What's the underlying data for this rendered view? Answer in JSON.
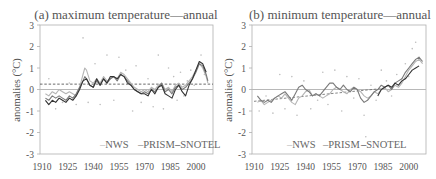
{
  "chart_data": [
    {
      "type": "line",
      "panel": "a",
      "title": "(a) maximum temperature—annual",
      "xlabel": "",
      "ylabel": "anomalies (°C)",
      "xlim": [
        1910,
        2010
      ],
      "ylim": [
        -3,
        3
      ],
      "xticks": [
        1910,
        1925,
        1940,
        1955,
        1970,
        1985,
        2000
      ],
      "yticks": [
        3,
        2,
        1,
        0,
        -1,
        -2,
        -3
      ],
      "grid": false,
      "legend_position": "bottom-inside",
      "reference_lines": [
        {
          "name": "zero",
          "y": 0,
          "style": "solid",
          "color": "#b8b8b8"
        },
        {
          "name": "trend",
          "y": 0.25,
          "style": "dashed",
          "color": "#444444"
        }
      ],
      "series": [
        {
          "name": "NWS",
          "color": "#b5b5b5",
          "width": 1.1,
          "x": [
            1912,
            1914,
            1916,
            1918,
            1920,
            1922,
            1924,
            1926,
            1928,
            1930,
            1932,
            1934,
            1935,
            1936,
            1938,
            1940,
            1942,
            1944,
            1946,
            1948,
            1950,
            1952,
            1954,
            1956,
            1958,
            1960,
            1962,
            1964,
            1966,
            1968,
            1970,
            1972,
            1974,
            1976,
            1978,
            1980,
            1982,
            1984,
            1986,
            1988,
            1990,
            1992,
            1994,
            1996,
            1998,
            2000,
            2002,
            2004,
            2006,
            2007
          ],
          "y": [
            -0.2,
            -0.3,
            -0.1,
            -0.2,
            0.0,
            -0.1,
            -0.2,
            -0.1,
            -0.2,
            -0.3,
            0.1,
            0.7,
            1.0,
            0.9,
            0.4,
            0.3,
            0.5,
            0.3,
            0.6,
            0.4,
            0.5,
            0.6,
            0.5,
            0.8,
            0.7,
            0.5,
            0.3,
            0.1,
            0.0,
            -0.1,
            0.0,
            -0.1,
            0.1,
            0.0,
            0.2,
            0.3,
            0.0,
            0.1,
            -0.1,
            0.2,
            0.3,
            0.1,
            0.2,
            0.4,
            0.6,
            0.9,
            1.2,
            1.0,
            0.6,
            0.3
          ]
        },
        {
          "name": "PRISM",
          "color": "#7a7a7a",
          "width": 1.1,
          "x": [
            1912,
            1914,
            1916,
            1918,
            1920,
            1922,
            1924,
            1926,
            1928,
            1930,
            1932,
            1934,
            1935,
            1936,
            1938,
            1940,
            1942,
            1944,
            1946,
            1948,
            1950,
            1952,
            1954,
            1956,
            1958,
            1960,
            1962,
            1964,
            1966,
            1968,
            1970,
            1972,
            1974,
            1976,
            1978,
            1980,
            1982,
            1984,
            1986,
            1988,
            1990,
            1992,
            1994,
            1996,
            1998,
            2000,
            2002,
            2004,
            2006,
            2007
          ],
          "y": [
            -0.4,
            -0.5,
            -0.3,
            -0.4,
            -0.3,
            -0.4,
            -0.5,
            -0.3,
            -0.4,
            -0.2,
            0.1,
            0.4,
            0.6,
            0.5,
            0.2,
            0.1,
            0.4,
            0.2,
            0.5,
            0.3,
            0.5,
            0.6,
            0.4,
            0.7,
            0.6,
            0.4,
            0.2,
            0.0,
            -0.1,
            -0.2,
            -0.1,
            -0.2,
            0.0,
            -0.1,
            0.1,
            0.3,
            -0.1,
            0.0,
            -0.2,
            0.1,
            0.2,
            0.0,
            0.1,
            0.3,
            0.5,
            0.8,
            1.2,
            1.1,
            0.7,
            0.4
          ]
        },
        {
          "name": "SNOTEL",
          "color": "#333333",
          "width": 1.1,
          "x": [
            1912,
            1914,
            1916,
            1918,
            1920,
            1922,
            1924,
            1926,
            1928,
            1930,
            1932,
            1934,
            1936,
            1938,
            1940,
            1942,
            1944,
            1946,
            1948,
            1950,
            1952,
            1954,
            1956,
            1958,
            1960,
            1962,
            1964,
            1966,
            1968,
            1970,
            1972,
            1974,
            1976,
            1978,
            1980,
            1982,
            1984,
            1986,
            1988,
            1990,
            1992,
            1994,
            1996,
            1998,
            2000,
            2002,
            2004,
            2006
          ],
          "y": [
            -0.5,
            -0.7,
            -0.5,
            -0.6,
            -0.4,
            -0.5,
            -0.6,
            -0.4,
            -0.5,
            -0.3,
            0.0,
            0.4,
            0.5,
            0.2,
            0.1,
            0.5,
            0.2,
            0.5,
            0.3,
            0.6,
            0.6,
            0.5,
            0.7,
            0.6,
            0.3,
            0.2,
            0.0,
            -0.1,
            -0.2,
            -0.2,
            -0.3,
            0.0,
            -0.2,
            0.1,
            0.2,
            -0.2,
            -0.3,
            -0.4,
            0.0,
            0.2,
            -0.1,
            -0.3,
            0.2,
            0.5,
            0.9,
            1.3,
            1.2,
            0.8
          ]
        }
      ],
      "scatter_points": {
        "color": "#bdbdbd",
        "points": [
          [
            1914,
            0.5
          ],
          [
            1918,
            -0.9
          ],
          [
            1922,
            -0.6
          ],
          [
            1926,
            0.3
          ],
          [
            1930,
            -0.7
          ],
          [
            1934,
            2.4
          ],
          [
            1937,
            -0.6
          ],
          [
            1941,
            1.2
          ],
          [
            1944,
            -0.7
          ],
          [
            1948,
            1.6
          ],
          [
            1952,
            -0.5
          ],
          [
            1955,
            1.5
          ],
          [
            1959,
            0.9
          ],
          [
            1963,
            -1.0
          ],
          [
            1965,
            1.1
          ],
          [
            1968,
            -0.6
          ],
          [
            1972,
            0.5
          ],
          [
            1975,
            -0.8
          ],
          [
            1978,
            1.6
          ],
          [
            1981,
            -0.9
          ],
          [
            1984,
            1.0
          ],
          [
            1987,
            0.6
          ],
          [
            1989,
            -0.5
          ],
          [
            1991,
            0.8
          ],
          [
            1993,
            -0.3
          ],
          [
            1995,
            0.4
          ],
          [
            1997,
            0.9
          ],
          [
            1999,
            0.2
          ],
          [
            2001,
            1.0
          ],
          [
            2003,
            1.6
          ],
          [
            2005,
            0.7
          ]
        ]
      },
      "legend": [
        "NWS",
        "PRISM",
        "SNOTEL"
      ]
    },
    {
      "type": "line",
      "panel": "b",
      "title": "(b) minimum temperature—annual",
      "xlabel": "",
      "ylabel": "anomalies (°C)",
      "xlim": [
        1910,
        2010
      ],
      "ylim": [
        -3,
        3
      ],
      "xticks": [
        1910,
        1925,
        1940,
        1955,
        1970,
        1985,
        2000
      ],
      "yticks": [
        3,
        2,
        1,
        0,
        -1,
        -2,
        -3
      ],
      "grid": false,
      "legend_position": "bottom-inside",
      "reference_lines": [
        {
          "name": "zero",
          "y": 0,
          "style": "solid",
          "color": "#b8b8b8"
        },
        {
          "name": "trend",
          "x0": 1910,
          "y0": -0.55,
          "x1": 1985,
          "y1": 0.05,
          "style": "dashed",
          "color": "#666666"
        }
      ],
      "series": [
        {
          "name": "NWS",
          "color": "#b5b5b5",
          "width": 1.1,
          "x": [
            1912,
            1914,
            1916,
            1918,
            1920,
            1922,
            1924,
            1926,
            1928,
            1930,
            1932,
            1934,
            1936,
            1938,
            1940,
            1942,
            1944,
            1946,
            1948,
            1950,
            1952,
            1954,
            1956,
            1958,
            1960,
            1962,
            1964,
            1966,
            1968,
            1970,
            1972,
            1974,
            1976,
            1978,
            1980,
            1982,
            1984,
            1986,
            1988,
            1990,
            1992,
            1994,
            1996,
            1998,
            2000,
            2002,
            2004,
            2006,
            2008
          ],
          "y": [
            -0.6,
            -0.5,
            -0.7,
            -0.6,
            -0.5,
            -0.4,
            -0.3,
            -0.4,
            -0.2,
            -0.4,
            -0.6,
            -0.7,
            -0.4,
            -0.3,
            -0.1,
            0.0,
            -0.3,
            -0.2,
            -0.3,
            -0.4,
            -0.3,
            -0.2,
            0.0,
            0.1,
            0.0,
            -0.1,
            -0.2,
            0.0,
            0.1,
            0.0,
            -0.1,
            -0.3,
            -0.4,
            -0.3,
            -0.1,
            -0.2,
            0.0,
            0.1,
            -0.1,
            0.0,
            0.2,
            0.1,
            0.3,
            0.6,
            0.9,
            1.1,
            1.3,
            1.4,
            1.2
          ]
        },
        {
          "name": "PRISM",
          "color": "#7a7a7a",
          "width": 1.1,
          "x": [
            1912,
            1914,
            1916,
            1918,
            1920,
            1922,
            1924,
            1926,
            1928,
            1930,
            1932,
            1934,
            1936,
            1938,
            1940,
            1942,
            1944,
            1946,
            1948,
            1950,
            1952,
            1954,
            1956,
            1958,
            1960,
            1962,
            1964,
            1966,
            1968,
            1970,
            1972,
            1974,
            1976,
            1978,
            1980,
            1982,
            1984,
            1986,
            1988,
            1990,
            1992,
            1994,
            1996,
            1998,
            2000,
            2002,
            2004,
            2006,
            2008
          ],
          "y": [
            -0.3,
            -0.5,
            -0.6,
            -0.5,
            -0.6,
            -0.4,
            -0.3,
            -0.2,
            -0.1,
            -0.3,
            -0.5,
            -0.2,
            0.1,
            0.2,
            0.0,
            -0.1,
            -0.3,
            -0.2,
            -0.3,
            -0.1,
            0.1,
            0.3,
            0.3,
            0.1,
            0.0,
            0.2,
            0.0,
            -0.1,
            0.1,
            0.0,
            -0.4,
            -0.6,
            -0.5,
            -0.3,
            -0.1,
            0.0,
            0.2,
            0.1,
            0.2,
            0.0,
            0.3,
            0.4,
            0.5,
            0.8,
            1.0,
            1.2,
            1.4,
            1.5,
            1.3
          ]
        },
        {
          "name": "SNOTEL",
          "color": "#333333",
          "width": 1.1,
          "x": [
            1982,
            1984,
            1986,
            1988,
            1990,
            1992,
            1994,
            1996,
            1998,
            2000,
            2002,
            2004,
            2006
          ],
          "y": [
            -0.3,
            0.0,
            0.1,
            0.2,
            0.1,
            0.3,
            0.2,
            0.4,
            0.5,
            0.7,
            0.9,
            1.0,
            1.1
          ]
        }
      ],
      "scatter_points": {
        "color": "#bdbdbd",
        "points": [
          [
            1913,
            -1.0
          ],
          [
            1917,
            -0.3
          ],
          [
            1921,
            -1.1
          ],
          [
            1925,
            0.7
          ],
          [
            1928,
            -0.9
          ],
          [
            1932,
            0.6
          ],
          [
            1935,
            -1.2
          ],
          [
            1939,
            0.4
          ],
          [
            1943,
            -0.9
          ],
          [
            1947,
            -0.5
          ],
          [
            1950,
            0.8
          ],
          [
            1953,
            -0.7
          ],
          [
            1957,
            0.9
          ],
          [
            1961,
            -1.0
          ],
          [
            1964,
            0.6
          ],
          [
            1968,
            -0.4
          ],
          [
            1971,
            0.5
          ],
          [
            1974,
            -1.2
          ],
          [
            1975,
            -2.2
          ],
          [
            1978,
            0.2
          ],
          [
            1981,
            -0.5
          ],
          [
            1984,
            0.9
          ],
          [
            1987,
            0.4
          ],
          [
            1990,
            -0.3
          ],
          [
            1993,
            0.7
          ],
          [
            1996,
            0.5
          ],
          [
            1998,
            1.2
          ],
          [
            2000,
            0.6
          ],
          [
            2002,
            1.9
          ],
          [
            2004,
            2.2
          ],
          [
            2006,
            1.5
          ]
        ]
      },
      "legend": [
        "NWS",
        "PRISM",
        "SNOTEL"
      ]
    }
  ],
  "panels": [
    {
      "title": "(a) maximum temperature—annual",
      "ylabel": "anomalies (°C)",
      "legend": [
        "NWS",
        "PRISM",
        "SNOTEL"
      ],
      "legend_markers": [
        "–",
        "–",
        "–"
      ]
    },
    {
      "title": "(b) minimum temperature—annual",
      "ylabel": "anomalies (°C)",
      "legend": [
        "NWS",
        "PRISM",
        "SNOTEL"
      ],
      "legend_markers": [
        "–",
        "–",
        "–"
      ]
    }
  ],
  "style": {
    "axis_color": "#b0b0b0",
    "text_color": "#555555",
    "background": "#ffffff"
  }
}
